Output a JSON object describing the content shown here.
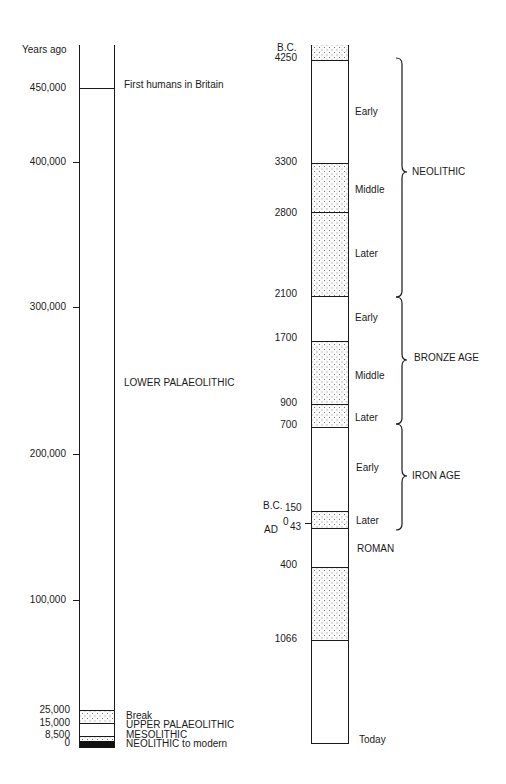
{
  "left_timeline": {
    "header": "Years ago",
    "ticks": [
      {
        "label": "450,000",
        "y": 88
      },
      {
        "label": "400,000",
        "y": 162
      },
      {
        "label": "300,000",
        "y": 307
      },
      {
        "label": "200,000",
        "y": 454
      },
      {
        "label": "100,000",
        "y": 600
      },
      {
        "label": "25,000",
        "y": 711
      },
      {
        "label": "15,000",
        "y": 723
      },
      {
        "label": "8,500",
        "y": 735
      },
      {
        "label": "0",
        "y": 743
      }
    ],
    "events": [
      {
        "label": "First humans in Britain",
        "y": 88
      },
      {
        "label": "LOWER PALAEOLITHIC",
        "y": 382
      },
      {
        "label": "Break",
        "y": 716
      },
      {
        "label": "UPPER PALAEOLITHIC",
        "y": 725
      },
      {
        "label": "MESOLITHIC",
        "y": 735
      },
      {
        "label": "NEOLITHIC to modern",
        "y": 744
      }
    ]
  },
  "right_timeline": {
    "header": "B.C.",
    "ticks": [
      {
        "label": "4250",
        "y": 58
      },
      {
        "label": "3300",
        "y": 162
      },
      {
        "label": "2800",
        "y": 213
      },
      {
        "label": "2100",
        "y": 294
      },
      {
        "label": "1700",
        "y": 338
      },
      {
        "label": "900",
        "y": 403
      },
      {
        "label": "700",
        "y": 425
      },
      {
        "label": "B.C.",
        "y": 508
      },
      {
        "label": "150",
        "y": 508
      },
      {
        "label": "0",
        "y": 522
      },
      {
        "label": "AD",
        "y": 531
      },
      {
        "label": "43",
        "y": 529
      },
      {
        "label": "400",
        "y": 565
      },
      {
        "label": "1066",
        "y": 639
      }
    ],
    "periods": [
      {
        "label": "Early",
        "y": 112
      },
      {
        "label": "Middle",
        "y": 190
      },
      {
        "label": "Later",
        "y": 254
      },
      {
        "label": "Early",
        "y": 318
      },
      {
        "label": "Middle",
        "y": 376
      },
      {
        "label": "Later",
        "y": 418
      },
      {
        "label": "Early",
        "y": 468
      },
      {
        "label": "Later",
        "y": 521
      },
      {
        "label": "ROMAN",
        "y": 549
      },
      {
        "label": "Today",
        "y": 740
      }
    ],
    "eras": [
      {
        "label": "NEOLITHIC",
        "y": 172
      },
      {
        "label": "BRONZE AGE",
        "y": 358
      },
      {
        "label": "IRON AGE",
        "y": 476
      }
    ]
  }
}
